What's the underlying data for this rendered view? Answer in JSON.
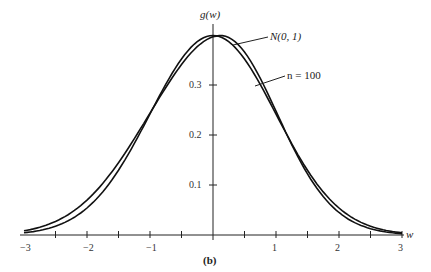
{
  "chart_data": {
    "type": "line",
    "title": "",
    "caption": "(b)",
    "xlabel": "w",
    "ylabel": "g(w)",
    "xlim": [
      -3,
      3
    ],
    "ylim": [
      0,
      0.4
    ],
    "x_ticks": [
      "-3",
      "-2",
      "-1",
      "1",
      "2",
      "3"
    ],
    "y_ticks": [
      "0.1",
      "0.2",
      "0.3"
    ],
    "grid": false,
    "legend_position": "annotations",
    "series": [
      {
        "name": "N(0, 1)",
        "x": [
          -3,
          -2.5,
          -2,
          -1.5,
          -1,
          -0.5,
          0,
          0.5,
          1,
          1.5,
          2,
          2.5,
          3
        ],
        "values": [
          0.004,
          0.018,
          0.054,
          0.13,
          0.242,
          0.352,
          0.399,
          0.352,
          0.242,
          0.13,
          0.054,
          0.018,
          0.004
        ]
      },
      {
        "name": "n = 100",
        "x": [
          -3,
          -2.5,
          -2,
          -1.5,
          -1,
          -0.5,
          0,
          0.5,
          1,
          1.5,
          2,
          2.5,
          3
        ],
        "values": [
          0.006,
          0.025,
          0.06,
          0.128,
          0.222,
          0.33,
          0.399,
          0.365,
          0.25,
          0.128,
          0.05,
          0.015,
          0.003
        ]
      }
    ]
  },
  "labels": {
    "ylabel": "g(w)",
    "xlabel": "w",
    "caption": "(b)",
    "series1": "N(0, 1)",
    "series2": "n = 100"
  }
}
